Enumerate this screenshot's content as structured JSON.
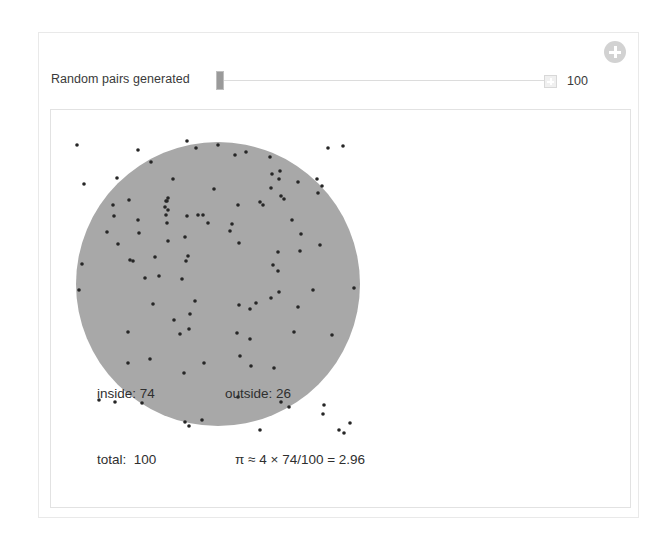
{
  "panel": {
    "name": "monte-carlo-pi-simulation"
  },
  "header": {
    "add_button_icon": "plus-circle-icon"
  },
  "slider": {
    "label": "Random pairs generated",
    "value": 100,
    "value_display": "100",
    "handle_position_percent": 0,
    "stepper_icon": "plus-box-icon"
  },
  "readout": {
    "inside_label": "inside: 74",
    "outside_label": "outside: 26",
    "total_label": "total:  100",
    "pi_expression": "π ≈ 4 × 74/100 = 2.96"
  },
  "colors": {
    "circle_fill": "#a8a8a8",
    "point": "#262626",
    "panel_border": "#e9e9e9",
    "plot_border": "#e2e2e2",
    "slider_handle": "#9a9a9a",
    "slider_track": "#dcdcdc",
    "add_button": "#d2d2d2",
    "text": "#2f2f2f"
  },
  "chart_data": {
    "type": "scatter",
    "title": "",
    "xlabel": "",
    "ylabel": "",
    "xlim": [
      -1,
      1
    ],
    "ylim": [
      -1,
      1
    ],
    "grid": false,
    "legend": null,
    "annotations": [
      "inside: 74",
      "outside: 26",
      "total:  100",
      "π ≈ 4 × 74/100 = 2.96"
    ],
    "shapes": [
      {
        "kind": "circle",
        "cx_px": 216,
        "cy_px": 282,
        "r_px": 142,
        "fill": "#a8a8a8"
      }
    ],
    "counts": {
      "inside": 74,
      "outside": 26,
      "total": 100,
      "pi_estimate": 2.96
    },
    "point_radius_px": 1.8,
    "point_color": "#262626",
    "points_px": [
      [
        75,
        143
      ],
      [
        136,
        148
      ],
      [
        149,
        160
      ],
      [
        185,
        139
      ],
      [
        194,
        146
      ],
      [
        216,
        143
      ],
      [
        233,
        153
      ],
      [
        244,
        150
      ],
      [
        268,
        155
      ],
      [
        270,
        172
      ],
      [
        278,
        169
      ],
      [
        269,
        186
      ],
      [
        326,
        146
      ],
      [
        341,
        144
      ],
      [
        82,
        182
      ],
      [
        115,
        176
      ],
      [
        171,
        177
      ],
      [
        277,
        177
      ],
      [
        296,
        180
      ],
      [
        315,
        177
      ],
      [
        320,
        184
      ],
      [
        316,
        191
      ],
      [
        127,
        198
      ],
      [
        164,
        199
      ],
      [
        212,
        187
      ],
      [
        258,
        200
      ],
      [
        279,
        194
      ],
      [
        282,
        197
      ],
      [
        111,
        203
      ],
      [
        163,
        205
      ],
      [
        164,
        213
      ],
      [
        166,
        208
      ],
      [
        165,
        199
      ],
      [
        166,
        196
      ],
      [
        236,
        203
      ],
      [
        261,
        203
      ],
      [
        165,
        221
      ],
      [
        112,
        214
      ],
      [
        136,
        218
      ],
      [
        185,
        214
      ],
      [
        196,
        213
      ],
      [
        201,
        213
      ],
      [
        206,
        221
      ],
      [
        230,
        222
      ],
      [
        290,
        218
      ],
      [
        105,
        230
      ],
      [
        137,
        231
      ],
      [
        183,
        235
      ],
      [
        228,
        229
      ],
      [
        237,
        241
      ],
      [
        299,
        232
      ],
      [
        318,
        243
      ],
      [
        116,
        242
      ],
      [
        166,
        239
      ],
      [
        186,
        254
      ],
      [
        276,
        250
      ],
      [
        128,
        258
      ],
      [
        153,
        255
      ],
      [
        298,
        249
      ],
      [
        80,
        262
      ],
      [
        131,
        259
      ],
      [
        184,
        259
      ],
      [
        276,
        269
      ],
      [
        271,
        263
      ],
      [
        77,
        288
      ],
      [
        143,
        276
      ],
      [
        157,
        274
      ],
      [
        180,
        277
      ],
      [
        254,
        301
      ],
      [
        269,
        296
      ],
      [
        277,
        290
      ],
      [
        311,
        288
      ],
      [
        352,
        286
      ],
      [
        151,
        302
      ],
      [
        193,
        299
      ],
      [
        172,
        318
      ],
      [
        188,
        312
      ],
      [
        237,
        303
      ],
      [
        296,
        305
      ],
      [
        248,
        307
      ],
      [
        187,
        327
      ],
      [
        235,
        331
      ],
      [
        330,
        333
      ],
      [
        126,
        330
      ],
      [
        248,
        337
      ],
      [
        178,
        332
      ],
      [
        292,
        330
      ],
      [
        126,
        361
      ],
      [
        148,
        357
      ],
      [
        202,
        361
      ],
      [
        238,
        354
      ],
      [
        249,
        364
      ],
      [
        272,
        366
      ],
      [
        182,
        371
      ],
      [
        97,
        398
      ],
      [
        113,
        400
      ],
      [
        140,
        401
      ],
      [
        236,
        395
      ],
      [
        279,
        400
      ],
      [
        287,
        405
      ],
      [
        322,
        403
      ],
      [
        200,
        418
      ],
      [
        183,
        420
      ],
      [
        187,
        424
      ],
      [
        258,
        428
      ],
      [
        321,
        412
      ],
      [
        337,
        428
      ],
      [
        342,
        431
      ],
      [
        348,
        421
      ]
    ]
  }
}
